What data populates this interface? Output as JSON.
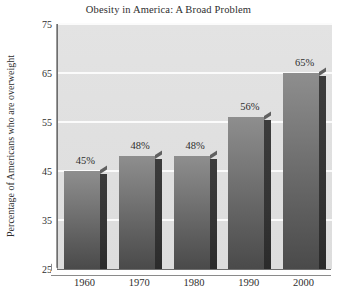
{
  "chart_data": {
    "type": "bar",
    "title": "Obesity in America: A Broad Problem",
    "xlabel": "",
    "ylabel": "Percentage of Americans who are overweight",
    "categories": [
      "1960",
      "1970",
      "1980",
      "1990",
      "2000"
    ],
    "values": [
      45,
      48,
      48,
      56,
      65
    ],
    "data_labels": [
      "45%",
      "48%",
      "48%",
      "56%",
      "65%"
    ],
    "ylim": [
      25,
      75
    ],
    "yticks": [
      25,
      35,
      45,
      55,
      65,
      75
    ],
    "ytick_labels": [
      "25",
      "35",
      "45",
      "55",
      "65",
      "75"
    ],
    "grid": true,
    "legend": false,
    "style": {
      "plot_background": "#e0e0e0",
      "gridline_color": "#fbfbfb",
      "bar_face_color": "#6e6e6e",
      "bar_side_color": "#333333",
      "axis_color": "#6e6e6e",
      "text_color": "#2e2e2e",
      "figure_background": "#ffffff"
    }
  }
}
